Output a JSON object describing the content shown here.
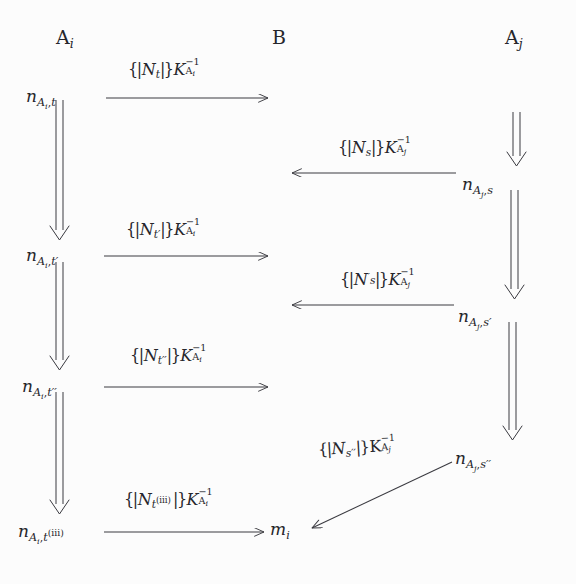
{
  "figure": {
    "kind": "message-sequence-diagram",
    "background_color": "#fcfcfc",
    "ink_color": "#26262b",
    "width": 576,
    "height": 584
  },
  "columns": {
    "headers": [
      {
        "id": "col-ai",
        "label_base": "A",
        "label_sub": "i",
        "x": 56,
        "y": 28
      },
      {
        "id": "col-b",
        "label_base": "B",
        "label_sub": "",
        "x": 272,
        "y": 28
      },
      {
        "id": "col-aj",
        "label_base": "A",
        "label_sub": "j",
        "x": 505,
        "y": 28
      }
    ]
  },
  "nodes": [
    {
      "id": "n-ai-t",
      "base": "n",
      "sub_agent": "A",
      "sub_agent_idx": "i",
      "sub_time": "t",
      "time_prime": "",
      "time_roman": "",
      "x": 26,
      "y": 88
    },
    {
      "id": "n-ai-t1",
      "base": "n",
      "sub_agent": "A",
      "sub_agent_idx": "i",
      "sub_time": "t",
      "time_prime": "′",
      "time_roman": "",
      "x": 26,
      "y": 247
    },
    {
      "id": "n-ai-t2",
      "base": "n",
      "sub_agent": "A",
      "sub_agent_idx": "i",
      "sub_time": "t",
      "time_prime": "′′",
      "time_roman": "",
      "x": 22,
      "y": 378
    },
    {
      "id": "n-ai-t3",
      "base": "n",
      "sub_agent": "A",
      "sub_agent_idx": "i",
      "sub_time": "t",
      "time_prime": "",
      "time_roman": "(iii)",
      "x": 18,
      "y": 523
    },
    {
      "id": "n-mi",
      "base": "m",
      "sub_agent": "",
      "sub_agent_idx": "i",
      "sub_time": "",
      "time_prime": "",
      "time_roman": "",
      "x": 270,
      "y": 521
    },
    {
      "id": "n-aj-s",
      "base": "n",
      "sub_agent": "A",
      "sub_agent_idx": "j",
      "sub_time": "s",
      "time_prime": "",
      "time_roman": "",
      "x": 462,
      "y": 176
    },
    {
      "id": "n-aj-s1",
      "base": "n",
      "sub_agent": "A",
      "sub_agent_idx": "j",
      "sub_time": "s",
      "time_prime": "′",
      "time_roman": "",
      "x": 458,
      "y": 308
    },
    {
      "id": "n-aj-s2",
      "base": "n",
      "sub_agent": "A",
      "sub_agent_idx": "j",
      "sub_time": "s",
      "time_prime": "′′",
      "time_roman": "",
      "x": 455,
      "y": 450
    }
  ],
  "messages": [
    {
      "id": "msg-1",
      "direction": "left-to-right",
      "from": "n-ai-t",
      "to": "col-b",
      "nonce": "N",
      "nonce_prime": "",
      "nonce_sub": "t",
      "nonce_sub_roman": "",
      "key": "K",
      "key_agent": "A",
      "key_agent_idx": "i",
      "key_exponent": "−1",
      "label_x": 128,
      "label_y": 62
    },
    {
      "id": "msg-2",
      "direction": "right-to-left",
      "from": "n-aj-s",
      "to": "col-b",
      "nonce": "N",
      "nonce_prime": "",
      "nonce_sub": "s",
      "nonce_sub_roman": "",
      "key": "K",
      "key_agent": "A",
      "key_agent_idx": "j",
      "key_exponent": "−1",
      "label_x": 338,
      "label_y": 140
    },
    {
      "id": "msg-3",
      "direction": "left-to-right",
      "from": "n-ai-t1",
      "to": "col-b",
      "nonce": "N",
      "nonce_prime": "′",
      "nonce_sub": "t",
      "nonce_sub_roman": "",
      "key": "K",
      "key_agent": "A",
      "key_agent_idx": "i",
      "key_exponent": "−1",
      "label_x": 126,
      "label_y": 222
    },
    {
      "id": "msg-4",
      "direction": "right-to-left",
      "from": "n-aj-s1",
      "to": "col-b",
      "nonce": "N",
      "nonce_prime": "′",
      "nonce_sub": "s",
      "nonce_sub_roman": "",
      "key": "K",
      "key_agent": "A",
      "key_agent_idx": "j",
      "key_exponent": "−1",
      "label_x": 340,
      "label_y": 272
    },
    {
      "id": "msg-5",
      "direction": "left-to-right",
      "from": "n-ai-t2",
      "to": "col-b",
      "nonce": "N",
      "nonce_prime": "′′",
      "nonce_sub": "t",
      "nonce_sub_roman": "",
      "key": "K",
      "key_agent": "A",
      "key_agent_idx": "i",
      "key_exponent": "−1",
      "label_x": 130,
      "label_y": 348
    },
    {
      "id": "msg-6",
      "direction": "diagonal-down-left",
      "from": "n-aj-s2",
      "to": "n-mi",
      "nonce": "N",
      "nonce_prime": "′′",
      "nonce_sub": "s",
      "nonce_sub_roman": "",
      "key": "K",
      "key_agent": "A",
      "key_agent_idx": "j",
      "key_exponent": "−1",
      "label_x": 318,
      "label_y": 442
    },
    {
      "id": "msg-7",
      "direction": "left-to-right",
      "from": "n-ai-t3",
      "to": "n-mi",
      "nonce": "N",
      "nonce_prime": "",
      "nonce_sub": "t",
      "nonce_sub_roman": "(iii)",
      "key": "K",
      "key_agent": "A",
      "key_agent_idx": "i",
      "key_exponent": "−1",
      "label_x": 124,
      "label_y": 492
    }
  ],
  "local_transitions": [
    {
      "id": "trans-ai-1",
      "glyph": "double-down-arrow",
      "column": "A_i",
      "x": 60,
      "y_from": 100,
      "y_to": 238
    },
    {
      "id": "trans-ai-2",
      "glyph": "double-down-arrow",
      "column": "A_i",
      "x": 60,
      "y_from": 258,
      "y_to": 368
    },
    {
      "id": "trans-ai-3",
      "glyph": "double-down-arrow",
      "column": "A_i",
      "x": 60,
      "y_from": 390,
      "y_to": 512
    },
    {
      "id": "trans-aj-0",
      "glyph": "double-down-arrow",
      "column": "A_j",
      "x": 516,
      "y_from": 110,
      "y_to": 166
    },
    {
      "id": "trans-aj-1",
      "glyph": "double-down-arrow",
      "column": "A_j",
      "x": 514,
      "y_from": 188,
      "y_to": 298
    },
    {
      "id": "trans-aj-2",
      "glyph": "double-down-arrow",
      "column": "A_j",
      "x": 512,
      "y_from": 320,
      "y_to": 440
    }
  ],
  "accessibility": {
    "alt": "Message sequence chart between principals A_i, B and A_j exchanging signed nonces"
  }
}
